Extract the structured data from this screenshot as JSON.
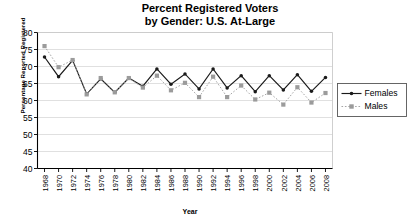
{
  "chart_data": {
    "type": "line",
    "title": "Percent Registered Voters by Gender: U.S. At-Large",
    "title_line1": "Percent Registered Voters",
    "title_line2": "by Gender: U.S. At-Large",
    "xlabel": "Year",
    "ylabel": "Percentage Reported Registered",
    "ylim": [
      40,
      80
    ],
    "ytick_step": 5,
    "yticks": [
      "40",
      "45",
      "50",
      "55",
      "60",
      "65",
      "70",
      "75",
      "80"
    ],
    "grid": true,
    "legend_position": "right",
    "x": [
      1968,
      1970,
      1972,
      1974,
      1976,
      1978,
      1980,
      1982,
      1984,
      1986,
      1988,
      1990,
      1992,
      1994,
      1996,
      1998,
      2000,
      2002,
      2004,
      2006,
      2008
    ],
    "categories": [
      "1968",
      "1970",
      "1972",
      "1974",
      "1976",
      "1978",
      "1980",
      "1982",
      "1984",
      "1986",
      "1988",
      "1990",
      "1992",
      "1994",
      "1996",
      "1998",
      "2000",
      "2002",
      "2004",
      "2006",
      "2008"
    ],
    "xtick_labels": [
      "1968",
      "1970",
      "1972",
      "1974",
      "1976",
      "1978",
      "1980",
      "1982",
      "1984",
      "1986",
      "1988",
      "1990",
      "1992",
      "1994",
      "1996",
      "1998",
      "2000",
      "2002",
      "2004",
      "2006",
      "2008"
    ],
    "series": [
      {
        "name": "Females",
        "color": "#1a1a1a",
        "style": "solid",
        "marker": "circle",
        "values": [
          72.8,
          67.0,
          71.8,
          61.9,
          66.4,
          62.4,
          66.6,
          64.2,
          69.3,
          64.8,
          67.8,
          63.4,
          69.3,
          63.7,
          67.3,
          62.6,
          67.3,
          63.1,
          67.6,
          62.7,
          66.8
        ]
      },
      {
        "name": "Males",
        "color": "#9b9b9b",
        "style": "dotted",
        "marker": "square",
        "values": [
          76.0,
          69.8,
          71.9,
          61.8,
          66.6,
          62.4,
          66.6,
          63.8,
          67.3,
          63.0,
          65.2,
          61.0,
          67.0,
          61.0,
          64.4,
          60.3,
          62.3,
          58.8,
          63.9,
          59.4,
          62.2
        ]
      }
    ]
  },
  "legend": {
    "items": [
      {
        "label": "Females"
      },
      {
        "label": "Males"
      }
    ]
  }
}
